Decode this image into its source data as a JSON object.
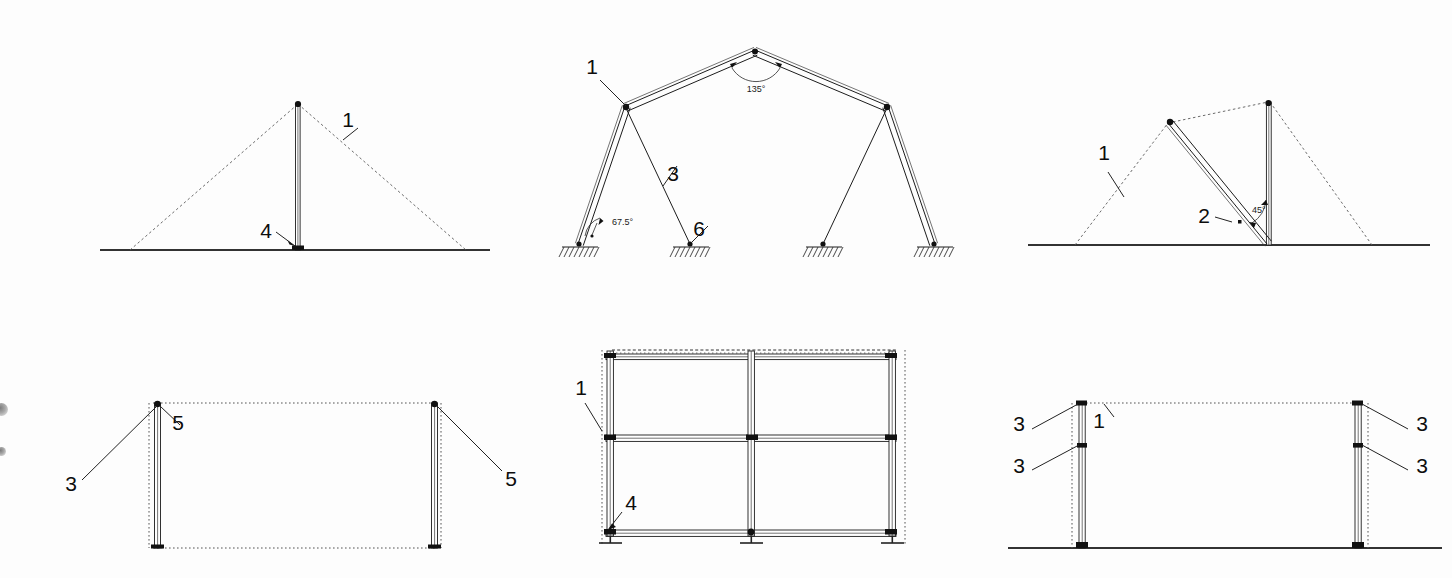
{
  "sheet": {
    "title": "Technical Drawing Sheet",
    "background_color": "#fdfdfd",
    "line_color": "#1c1c1c",
    "width": 1452,
    "height": 578
  },
  "artifacts": {
    "punch_marks": [
      {
        "name": "edge-smudge-upper",
        "x": 0,
        "y": 403,
        "d": 13
      },
      {
        "name": "edge-smudge-lower",
        "x": 0,
        "y": 447,
        "d": 9
      }
    ]
  },
  "figures": [
    {
      "id": "fig-1",
      "name": "single-mast-elevation",
      "position": "top-left",
      "description": "Vertical mast on ground line with dashed triangular envelope",
      "labels": [
        {
          "text": "1",
          "x": 348,
          "y": 127,
          "target": "dashed-roof-line"
        },
        {
          "text": "4",
          "x": 266,
          "y": 238,
          "target": "mast-base-node"
        }
      ],
      "angles": []
    },
    {
      "id": "fig-2",
      "name": "portal-gable-frame-elevation",
      "position": "top-center",
      "description": "Two-leg gable portal frame with guy members and hatched ground supports",
      "labels": [
        {
          "text": "1",
          "x": 592,
          "y": 68,
          "target": "eaves-node"
        },
        {
          "text": "3",
          "x": 673,
          "y": 173,
          "target": "guy-member"
        },
        {
          "text": "6",
          "x": 699,
          "y": 230,
          "target": "ground-anchor"
        }
      ],
      "angles": [
        {
          "text": "135°",
          "x": 748,
          "y": 90,
          "at": "apex"
        },
        {
          "text": "67.5°",
          "x": 591,
          "y": 224,
          "at": "left-leg-base"
        }
      ],
      "supports": 4
    },
    {
      "id": "fig-3",
      "name": "braced-mast-elevation",
      "position": "top-right",
      "description": "Vertical mast with diagonal strut at 45 degrees and dashed envelope",
      "labels": [
        {
          "text": "1",
          "x": 1104,
          "y": 153,
          "target": "dashed-roof-line"
        },
        {
          "text": "2",
          "x": 1204,
          "y": 214,
          "target": "diagonal-strut"
        }
      ],
      "angles": [
        {
          "text": "45°",
          "x": 1248,
          "y": 216,
          "at": "strut-to-mast"
        }
      ]
    },
    {
      "id": "fig-4",
      "name": "two-post-bay-plan",
      "position": "bottom-left",
      "description": "Two vertical posts linked by dotted top and bottom outline",
      "labels": [
        {
          "text": "5",
          "x": 176,
          "y": 421,
          "target": "left-post-head"
        },
        {
          "text": "3",
          "x": 68,
          "y": 484,
          "target": "left-post-head"
        },
        {
          "text": "5",
          "x": 509,
          "y": 480,
          "target": "right-post-head"
        }
      ],
      "angles": []
    },
    {
      "id": "fig-5",
      "name": "scaffold-grid-frame-elevation",
      "position": "bottom-center",
      "description": "Three-post two-bay frame with three horizontal rails and base plates",
      "labels": [
        {
          "text": "1",
          "x": 581,
          "y": 393,
          "target": "left-standard"
        },
        {
          "text": "4",
          "x": 631,
          "y": 515,
          "target": "base-plate"
        }
      ],
      "angles": [],
      "posts": 3,
      "rails": 3,
      "base_plates": 3
    },
    {
      "id": "fig-6",
      "name": "two-post-ground-elevation",
      "position": "bottom-right",
      "description": "Two posts standing on ground line with dotted envelope and joint markers",
      "labels": [
        {
          "text": "3",
          "x": 1018,
          "y": 423,
          "target": "left-post-head"
        },
        {
          "text": "1",
          "x": 1097,
          "y": 420,
          "target": "dotted-top-line"
        },
        {
          "text": "3",
          "x": 1424,
          "y": 423,
          "target": "right-post-head"
        },
        {
          "text": "3",
          "x": 1018,
          "y": 466,
          "target": "left-post-joint"
        },
        {
          "text": "3",
          "x": 1424,
          "y": 466,
          "target": "right-post-joint"
        }
      ],
      "angles": []
    }
  ]
}
